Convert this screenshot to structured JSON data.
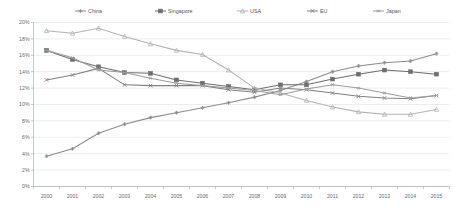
{
  "chart_data": {
    "type": "line",
    "title": "",
    "xlabel": "",
    "ylabel": "",
    "x": [
      "2000",
      "2001",
      "2002",
      "2003",
      "2004",
      "2005",
      "2006",
      "2007",
      "2008",
      "2009",
      "2010",
      "2011",
      "2012",
      "2013",
      "2014",
      "2015"
    ],
    "ylim": [
      0,
      20
    ],
    "ytick_labels": [
      "0%",
      "2%",
      "4%",
      "6%",
      "8%",
      "10%",
      "12%",
      "14%",
      "16%",
      "18%",
      "20%"
    ],
    "ytick_values": [
      0,
      2,
      4,
      6,
      8,
      10,
      12,
      14,
      16,
      18,
      20
    ],
    "grid": true,
    "legend_position": "top",
    "value_format": "percent",
    "series": [
      {
        "name": "China",
        "color": "#8c8c8c",
        "marker": "plus",
        "values": [
          3.7,
          4.6,
          6.5,
          7.6,
          8.4,
          9.0,
          9.6,
          10.2,
          10.9,
          11.7,
          12.8,
          14.0,
          14.7,
          15.1,
          15.3,
          16.2
        ]
      },
      {
        "name": "Singapore",
        "color": "#6e6e6e",
        "marker": "square",
        "values": [
          16.6,
          15.5,
          14.6,
          13.9,
          13.8,
          13.0,
          12.6,
          12.2,
          11.8,
          12.4,
          12.4,
          13.1,
          13.7,
          14.2,
          14.0,
          13.7
        ]
      },
      {
        "name": "USA",
        "color": "#b3b3b3",
        "marker": "triangle",
        "values": [
          19.0,
          18.7,
          19.3,
          18.3,
          17.4,
          16.6,
          16.1,
          14.2,
          12.0,
          11.4,
          10.5,
          9.7,
          9.1,
          8.8,
          8.8,
          9.4
        ]
      },
      {
        "name": "EU",
        "color": "#808080",
        "marker": "x",
        "values": [
          13.0,
          13.6,
          14.4,
          12.4,
          12.3,
          12.3,
          12.3,
          11.8,
          11.5,
          12.0,
          11.8,
          11.4,
          11.0,
          10.8,
          10.7,
          11.1
        ]
      },
      {
        "name": "Japan",
        "color": "#9d9d9d",
        "marker": "star",
        "values": [
          16.6,
          15.7,
          14.2,
          13.9,
          13.2,
          12.6,
          12.3,
          12.0,
          11.7,
          11.2,
          11.9,
          12.4,
          12.0,
          11.4,
          10.8,
          11.1
        ]
      }
    ]
  },
  "legend": {
    "items": [
      {
        "label": "China"
      },
      {
        "label": "Singapore"
      },
      {
        "label": "USA"
      },
      {
        "label": "EU"
      },
      {
        "label": "Japan"
      }
    ]
  }
}
